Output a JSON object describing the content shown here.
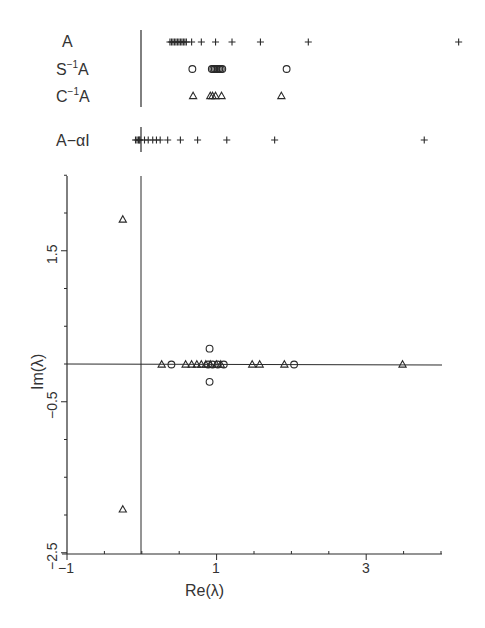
{
  "chart_data": [
    {
      "type": "scatter",
      "title": "Eigenvalue distributions (real line strips)",
      "strip_labels": [
        "A",
        "S⁻¹A",
        "C⁻¹A",
        "A−αI"
      ],
      "series": [
        {
          "name": "A",
          "marker": "plus",
          "x": [
            0.38,
            0.4,
            0.42,
            0.44,
            0.46,
            0.48,
            0.5,
            0.52,
            0.54,
            0.56,
            0.58,
            0.6,
            0.67,
            0.8,
            0.99,
            1.21,
            1.59,
            2.23,
            4.24
          ]
        },
        {
          "name": "S⁻¹A",
          "marker": "circle",
          "x": [
            0.68,
            0.94,
            0.96,
            0.98,
            1.0,
            1.02,
            1.04,
            1.06,
            1.08,
            1.94
          ]
        },
        {
          "name": "C⁻¹A",
          "marker": "triangle",
          "x": [
            0.69,
            0.92,
            0.95,
            0.99,
            1.07,
            1.87
          ]
        },
        {
          "name": "A−αI",
          "marker": "plus",
          "x": [
            -0.08,
            -0.06,
            -0.04,
            -0.03,
            -0.02,
            0.04,
            0.09,
            0.15,
            0.2,
            0.25,
            0.35,
            0.52,
            0.75,
            1.14,
            1.78,
            3.78
          ]
        }
      ],
      "xlim": [
        -1,
        4
      ]
    },
    {
      "type": "scatter",
      "title": "",
      "xlabel": "Re(λ)",
      "ylabel": "Im(λ)",
      "xlim": [
        -1,
        4
      ],
      "ylim": [
        -2.5,
        2.5
      ],
      "xticks": [
        -1,
        1,
        3
      ],
      "yticks": [
        -2.5,
        -0.5,
        1.5
      ],
      "xtick_minor_step": 0.5,
      "ytick_minor_step": 0.5,
      "grid": false,
      "series": [
        {
          "name": "triangles",
          "marker": "triangle",
          "points": [
            [
              -0.25,
              1.92
            ],
            [
              -0.25,
              -1.92
            ],
            [
              0.27,
              0.0
            ],
            [
              0.59,
              0.0
            ],
            [
              0.67,
              0.0
            ],
            [
              0.74,
              0.0
            ],
            [
              0.8,
              0.0
            ],
            [
              0.86,
              0.0
            ],
            [
              0.92,
              0.0
            ],
            [
              1.0,
              0.0
            ],
            [
              1.06,
              0.0
            ],
            [
              1.48,
              0.0
            ],
            [
              1.58,
              0.0
            ],
            [
              1.91,
              0.0
            ],
            [
              3.49,
              0.0
            ]
          ]
        },
        {
          "name": "circles",
          "marker": "circle",
          "points": [
            [
              0.4,
              0.0
            ],
            [
              0.89,
              0.0
            ],
            [
              0.95,
              0.0
            ],
            [
              1.02,
              0.0
            ],
            [
              1.1,
              0.0
            ],
            [
              0.91,
              0.21
            ],
            [
              0.91,
              -0.23
            ],
            [
              2.04,
              0.0
            ]
          ]
        }
      ]
    }
  ],
  "labels": {
    "strip_A": "A",
    "strip_S_base": "S",
    "strip_S_sup": "−1",
    "strip_S_tail": "A",
    "strip_C_base": "C",
    "strip_C_sup": "−1",
    "strip_C_tail": "A",
    "strip_shift": "A−αI",
    "xlabel": "Re(λ)",
    "ylabel": "Im(λ)",
    "xtick_m1": "−1",
    "xtick_1": "1",
    "xtick_3": "3",
    "ytick_15": "1.5",
    "ytick_m05": "−0.5",
    "ytick_m25": "−2.5"
  },
  "colors": {
    "ink": "#2a2a2a",
    "background": "#ffffff"
  }
}
